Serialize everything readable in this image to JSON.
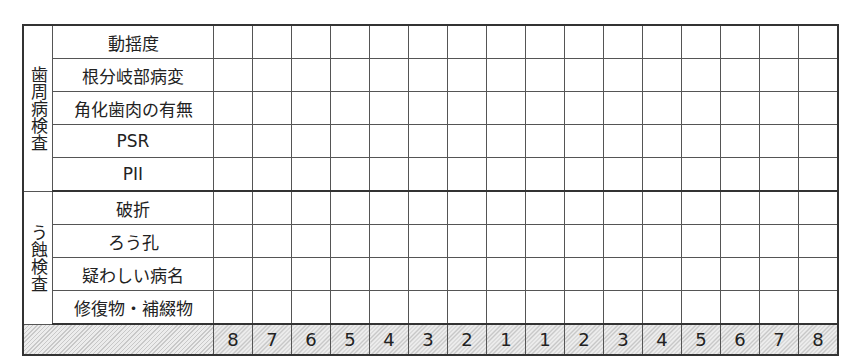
{
  "periodontal_section": {
    "title": "歯周病検査",
    "rows": [
      "動揺度",
      "根分岐部病変",
      "角化歯肉の有無",
      "PSR",
      "PII"
    ]
  },
  "caries_section": {
    "title": "う蝕検査",
    "rows": [
      "破折",
      "ろう孔",
      "疑わしい病名",
      "修復物・補綴物"
    ]
  },
  "tooth_numbers": [
    "8",
    "7",
    "6",
    "5",
    "4",
    "3",
    "2",
    "1",
    "1",
    "2",
    "3",
    "4",
    "5",
    "6",
    "7",
    "8"
  ]
}
